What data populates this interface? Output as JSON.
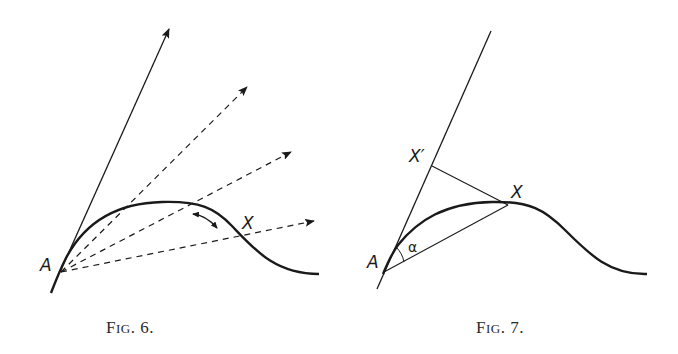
{
  "figures": [
    {
      "id": "fig6",
      "caption": {
        "prefix": "F",
        "smallcaps": "IG",
        "suffix": ". 6."
      },
      "labels": {
        "point_a": "A",
        "point_x": "X"
      },
      "elements": {
        "solid_ray": "tangent direction at A",
        "dashed_rays": 3,
        "curve": "hump-shaped curve through A",
        "rotation_arrow": "curved double arrow near peak"
      }
    },
    {
      "id": "fig7",
      "caption": {
        "prefix": "F",
        "smallcaps": "IG",
        "suffix": ". 7."
      },
      "labels": {
        "point_a": "A",
        "point_x": "X",
        "point_x_prime": "X′",
        "angle": "α"
      },
      "elements": {
        "tangent_line": "through A",
        "chord": "A to X",
        "perpendicular": "X to X′",
        "curve": "hump-shaped curve through A"
      }
    }
  ],
  "colors": {
    "ink": "#1a1a1a",
    "background": "#ffffff"
  }
}
